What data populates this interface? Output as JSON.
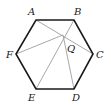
{
  "diagram": {
    "colors": {
      "edge": "#1a1a1a",
      "chord": "#a8a8a8",
      "label": "#222222"
    },
    "vertices": {
      "A": {
        "x": 36,
        "y": 20
      },
      "B": {
        "x": 74,
        "y": 20
      },
      "C": {
        "x": 93,
        "y": 54
      },
      "D": {
        "x": 74,
        "y": 89
      },
      "E": {
        "x": 36,
        "y": 89
      },
      "F": {
        "x": 16,
        "y": 54
      }
    },
    "point": {
      "name": "Q",
      "x": 63,
      "y": 35
    },
    "labels": {
      "A": "A",
      "B": "B",
      "C": "C",
      "D": "D",
      "E": "E",
      "F": "F",
      "Q": "Q"
    },
    "chords": [
      "A-C",
      "F-B",
      "E-B",
      "Q-D"
    ]
  }
}
